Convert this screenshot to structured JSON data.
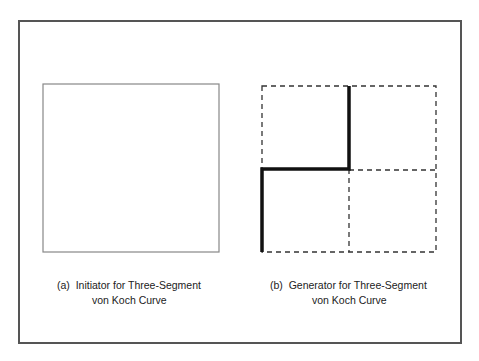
{
  "figure": {
    "panel_a": {
      "caption_line1": "(a)  Initiator for Three-Segment",
      "caption_line2": "von Koch Curve"
    },
    "panel_b": {
      "caption_line1": "(b)  Generator for Three-Segment",
      "caption_line2": "von Koch Curve"
    }
  },
  "colors": {
    "frame": "#555555",
    "initiator_square": "#888888",
    "dashed_grid": "#333333",
    "generator_path": "#111111"
  }
}
